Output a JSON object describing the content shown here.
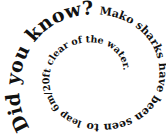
{
  "spiral_text": {
    "headline": "Did you know?",
    "body_part1": " Mako sharks have been seen to",
    "body_part2": " leap 6m/20ft clear of the water.",
    "full_text": "Did you know? Mako sharks have been seen to leap 6m/20ft clear of the water."
  },
  "colors": {
    "text": "#111111",
    "background": "#ffffff"
  }
}
